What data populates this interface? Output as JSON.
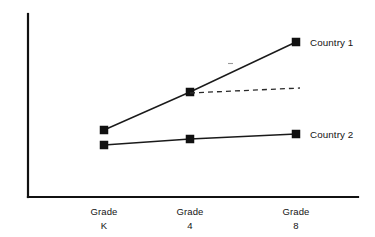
{
  "chart_data": {
    "type": "line",
    "title": "",
    "subtitle": "",
    "xlabel": "",
    "ylabel": "",
    "categories": [
      "Grade\nK",
      "Grade\n4",
      "Grade\n8"
    ],
    "tick_labels": [
      {
        "line1": "Grade",
        "line2": "K"
      },
      {
        "line1": "Grade",
        "line2": "4"
      },
      {
        "line1": "Grade",
        "line2": "8"
      }
    ],
    "grid": false,
    "legend_position": "right-of-last-point",
    "axis_style": "L-shaped, no ticks, no y-axis scale",
    "ylim": [
      0,
      100
    ],
    "series": [
      {
        "name": "Country 1",
        "label": "Country 1",
        "style": "solid",
        "marker": "filled-square",
        "color": "#111111",
        "values": [
          38,
          59,
          85
        ],
        "points_px": [
          {
            "x": 104,
            "y": 130
          },
          {
            "x": 190,
            "y": 92
          },
          {
            "x": 296,
            "y": 42
          }
        ]
      },
      {
        "name": "Country 2",
        "label": "Country 2",
        "style": "solid",
        "marker": "filled-square",
        "color": "#111111",
        "values": [
          30,
          33,
          36
        ],
        "points_px": [
          {
            "x": 104,
            "y": 145
          },
          {
            "x": 190,
            "y": 139
          },
          {
            "x": 296,
            "y": 134
          }
        ]
      }
    ],
    "annotations": [
      {
        "name": "projection-trend",
        "style": "dashed",
        "description": "dashed projection from Grade 4 point of Country 1",
        "values": [
          59,
          62
        ],
        "points_px": [
          {
            "x": 190,
            "y": 93
          },
          {
            "x": 300,
            "y": 88
          }
        ]
      }
    ],
    "axes_px": {
      "y_axis": {
        "x": 28,
        "y_top": 14,
        "y_bottom": 197
      },
      "x_axis": {
        "y": 197,
        "x_left": 28,
        "x_right": 358
      }
    },
    "colors": {
      "background": "#ffffff",
      "axis": "#111111",
      "series": "#111111",
      "projection": "#2a2a2a",
      "text": "#141414"
    }
  }
}
